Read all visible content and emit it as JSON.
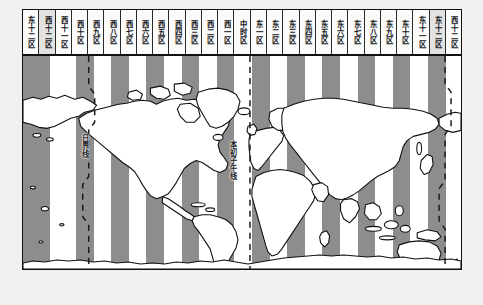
{
  "figure": {
    "dateline_label": "日界线",
    "meridian_label": "本初子午线"
  },
  "colors": {
    "page_background": "#f2f1ef",
    "stripe_gray": "#8d8d8d",
    "stripe_white": "#ffffff",
    "outline": "#111111",
    "land_fill": "#ffffff",
    "header_background": "#fbfbfa",
    "header_shaded": "#e2e2e0"
  },
  "zone_header": {
    "count": 25,
    "cells": [
      {
        "label": "东十二区",
        "shaded": false
      },
      {
        "label": "西十二区",
        "shaded": true
      },
      {
        "label": "西十一区",
        "shaded": false
      },
      {
        "label": "西十区",
        "shaded": false
      },
      {
        "label": "西九区",
        "shaded": false
      },
      {
        "label": "西八区",
        "shaded": false
      },
      {
        "label": "西七区",
        "shaded": false
      },
      {
        "label": "西六区",
        "shaded": false
      },
      {
        "label": "西五区",
        "shaded": false
      },
      {
        "label": "西四区",
        "shaded": false
      },
      {
        "label": "西三区",
        "shaded": false
      },
      {
        "label": "西二区",
        "shaded": false
      },
      {
        "label": "西一区",
        "shaded": false
      },
      {
        "label": "中时区",
        "shaded": false
      },
      {
        "label": "东一区",
        "shaded": false
      },
      {
        "label": "东二区",
        "shaded": false
      },
      {
        "label": "东三区",
        "shaded": false
      },
      {
        "label": "东四区",
        "shaded": false
      },
      {
        "label": "东五区",
        "shaded": false
      },
      {
        "label": "东六区",
        "shaded": false
      },
      {
        "label": "东七区",
        "shaded": false
      },
      {
        "label": "东八区",
        "shaded": false
      },
      {
        "label": "东九区",
        "shaded": false
      },
      {
        "label": "东十区",
        "shaded": false
      },
      {
        "label": "东十一区",
        "shaded": false
      },
      {
        "label": "东十二区",
        "shaded": true
      },
      {
        "label": "西十二区",
        "shaded": false
      }
    ]
  },
  "map": {
    "stripes": [
      {
        "x": 0,
        "width": 26.5
      },
      {
        "x": 53,
        "width": 17.6
      },
      {
        "x": 88.2,
        "width": 17.6
      },
      {
        "x": 123.4,
        "width": 17.6
      },
      {
        "x": 158.6,
        "width": 17.6
      },
      {
        "x": 193.8,
        "width": 17.6
      },
      {
        "x": 229.0,
        "width": 17.6
      },
      {
        "x": 264.2,
        "width": 17.6
      },
      {
        "x": 299.4,
        "width": 17.6
      },
      {
        "x": 334.6,
        "width": 17.6
      },
      {
        "x": 369.8,
        "width": 17.6
      },
      {
        "x": 405.0,
        "width": 17.6
      }
    ],
    "dashed_lines": [
      {
        "name": "date-line-west",
        "x": 66
      },
      {
        "name": "prime-meridian",
        "x": 228
      },
      {
        "name": "date-line-east",
        "x": 424
      }
    ]
  }
}
